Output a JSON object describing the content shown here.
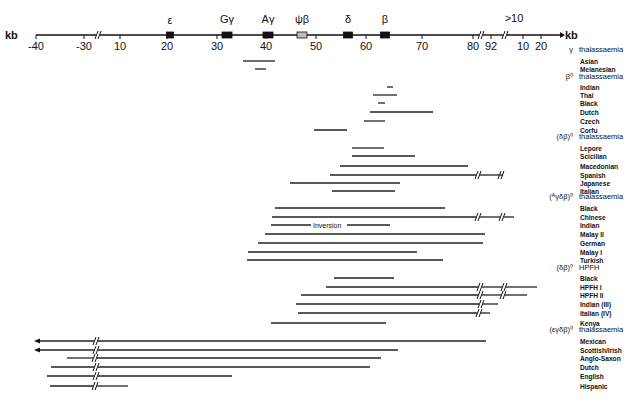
{
  "figure": {
    "axis": {
      "left_unit": "kb",
      "right_unit": "kb",
      "y": 35,
      "x_start": 36,
      "x_end": 560,
      "ticks": [
        {
          "label": "-40",
          "x": 36
        },
        {
          "label": "-30",
          "x": 84
        },
        {
          "label": "10",
          "x": 120
        },
        {
          "label": "20",
          "x": 167
        },
        {
          "label": "30",
          "x": 217
        },
        {
          "label": "40",
          "x": 266
        },
        {
          "label": "50",
          "x": 316
        },
        {
          "label": "60",
          "x": 366
        },
        {
          "label": "70",
          "x": 422
        },
        {
          "label": "80",
          "x": 473
        },
        {
          "label": "92",
          "x": 491
        },
        {
          "label": "10",
          "x": 523
        },
        {
          "label": "20",
          "x": 541
        }
      ],
      "breaks": [
        98,
        481,
        505
      ],
      "over_label": {
        "text": ">10",
        "x": 514,
        "y": 22
      }
    },
    "genes": [
      {
        "name": "ε",
        "x": 170,
        "w": 7,
        "fill": "#111",
        "label_y": 24,
        "small": true
      },
      {
        "name": "Gγ",
        "x": 227,
        "w": 10,
        "fill": "#111",
        "label_y": 23
      },
      {
        "name": "Aγ",
        "x": 268,
        "w": 10,
        "fill": "#111",
        "label_y": 23
      },
      {
        "name": "ψβ",
        "x": 302,
        "w": 10,
        "fill": "#bbb",
        "label_y": 23
      },
      {
        "name": "δ",
        "x": 348,
        "w": 9,
        "fill": "#111",
        "label_y": 23
      },
      {
        "name": "β",
        "x": 385,
        "w": 9,
        "fill": "#111",
        "label_y": 23
      }
    ],
    "groups": [
      {
        "prefix": "γ",
        "name": "thalassaemia",
        "label_y": 52,
        "rows": [
          {
            "label": "Asian",
            "y": 61,
            "x1": 243,
            "x2": 275
          },
          {
            "label": "Melanesian",
            "y": 69,
            "x1": 255,
            "x2": 266
          }
        ]
      },
      {
        "prefix": "β⁰",
        "name": "thalassaemia",
        "label_y": 79,
        "rows": [
          {
            "label": "Indian",
            "y": 87,
            "x1": 387,
            "x2": 393
          },
          {
            "label": "Thai",
            "y": 95,
            "x1": 373,
            "x2": 397
          },
          {
            "label": "Black",
            "y": 103,
            "x1": 378,
            "x2": 385
          },
          {
            "label": "Dutch",
            "y": 112,
            "x1": 370,
            "x2": 433
          },
          {
            "label": "Czech",
            "y": 121,
            "x1": 364,
            "x2": 385
          },
          {
            "label": "Corfu",
            "y": 130,
            "x1": 314,
            "x2": 347
          }
        ]
      },
      {
        "prefix": "(δβ)⁰",
        "name": "thalassaemia",
        "label_y": 139,
        "rows": [
          {
            "label": "Lepore",
            "y": 148,
            "x1": 352,
            "x2": 384
          },
          {
            "label": "Scicilian",
            "y": 156,
            "x1": 352,
            "x2": 415
          },
          {
            "label": "Macedonian",
            "y": 166,
            "x1": 340,
            "x2": 468
          },
          {
            "label": "Spanish",
            "y": 175,
            "x1": 330,
            "x2": 500,
            "breaks": [
              478,
              501
            ],
            "x2_after": 500
          },
          {
            "label": "Japanese",
            "y": 183,
            "x1": 290,
            "x2": 400
          },
          {
            "label": "Italian",
            "y": 191,
            "x1": 332,
            "x2": 395
          }
        ]
      },
      {
        "prefix": "(ᴬγδβ)⁰",
        "name": "thalassaemia",
        "label_y": 199,
        "rows": [
          {
            "label": "Black",
            "y": 208,
            "x1": 275,
            "x2": 445
          },
          {
            "label": "Chinese",
            "y": 217,
            "x1": 272,
            "x2": 514,
            "breaks": [
              478,
              502
            ]
          },
          {
            "label": "Indian",
            "y": 225,
            "x1": 271,
            "x2": 390,
            "inline": "Inversion",
            "inline_x": 313
          },
          {
            "label": "Malay II",
            "y": 234,
            "x1": 265,
            "x2": 485
          },
          {
            "label": "German",
            "y": 243,
            "x1": 258,
            "x2": 483
          },
          {
            "label": "Malay I",
            "y": 252,
            "x1": 248,
            "x2": 417
          },
          {
            "label": "Turkish",
            "y": 260,
            "x1": 247,
            "x2": 443
          }
        ]
      },
      {
        "prefix": "(δβ)⁰",
        "name": "HPFH",
        "label_y": 270,
        "rows": [
          {
            "label": "Black",
            "y": 278,
            "x1": 334,
            "x2": 394
          },
          {
            "label": "HPFH I",
            "y": 287,
            "x1": 326,
            "x2": 537,
            "breaks": [
              480,
              504
            ]
          },
          {
            "label": "HPFH II",
            "y": 295,
            "x1": 301,
            "x2": 527,
            "breaks": [
              480,
              503
            ]
          },
          {
            "label": "Indian (III)",
            "y": 304,
            "x1": 296,
            "x2": 498,
            "breaks": [
              481
            ]
          },
          {
            "label": "Italian (IV)",
            "y": 313,
            "x1": 298,
            "x2": 490,
            "breaks": [
              479
            ]
          },
          {
            "label": "Kenya",
            "y": 323,
            "x1": 271,
            "x2": 386
          }
        ]
      },
      {
        "prefix": "(εγδβ)⁰",
        "name": "thalassaemia",
        "label_y": 332,
        "rows": [
          {
            "label": "Mexican",
            "y": 341,
            "x1": 38,
            "x2": 486,
            "arrow": true,
            "breaks": [
              96
            ]
          },
          {
            "label": "Scottish/Irish",
            "y": 350,
            "x1": 38,
            "x2": 398,
            "arrow": true,
            "breaks": [
              96
            ]
          },
          {
            "label": "Anglo-Saxon",
            "y": 358,
            "x1": 67,
            "x2": 381,
            "breaks": [
              95
            ]
          },
          {
            "label": "Dutch",
            "y": 367,
            "x1": 51,
            "x2": 370,
            "breaks": [
              96
            ]
          },
          {
            "label": "English",
            "y": 376,
            "x1": 47,
            "x2": 232,
            "breaks": [
              96
            ]
          },
          {
            "label": "Hispanic",
            "y": 386,
            "x1": 50,
            "x2": 128,
            "breaks": [
              95
            ]
          }
        ]
      }
    ],
    "layout": {
      "label_x": 579,
      "prefix_right_x": 573
    }
  }
}
